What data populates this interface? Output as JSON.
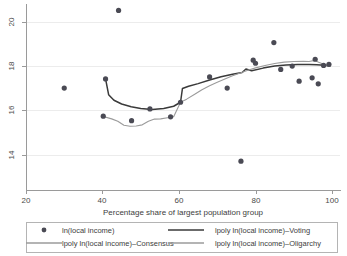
{
  "chart_data": {
    "type": "scatter",
    "title": "",
    "xlabel": "Percentage share of largest population group",
    "ylabel": "",
    "xlim": [
      20,
      100
    ],
    "ylim": [
      13.2,
      20.9
    ],
    "xticks": [
      20,
      40,
      60,
      80,
      100
    ],
    "yticks": [
      14,
      16,
      18,
      20
    ],
    "xticklabels": [
      "20",
      "40",
      "60",
      "80",
      "100"
    ],
    "yticklabels": [
      "14",
      "16",
      "18",
      "20"
    ],
    "grid": "horizontal",
    "legend_position": "below-axes",
    "marker_color": "#4a4a54",
    "series": [
      {
        "name": "ln(local income)",
        "type": "scatter",
        "color": "#4a4a54",
        "points": [
          [
            30.0,
            17.02
          ],
          [
            40.2,
            15.75
          ],
          [
            40.8,
            17.43
          ],
          [
            44.2,
            20.52
          ],
          [
            47.6,
            15.55
          ],
          [
            52.4,
            16.08
          ],
          [
            57.8,
            15.72
          ],
          [
            60.4,
            16.38
          ],
          [
            68.0,
            17.52
          ],
          [
            72.6,
            17.02
          ],
          [
            76.2,
            13.72
          ],
          [
            79.4,
            18.28
          ],
          [
            80.0,
            18.14
          ],
          [
            84.8,
            19.07
          ],
          [
            86.6,
            17.86
          ],
          [
            89.6,
            18.01
          ],
          [
            91.4,
            17.33
          ],
          [
            94.8,
            17.48
          ],
          [
            95.6,
            18.32
          ],
          [
            96.4,
            17.21
          ],
          [
            97.8,
            18.04
          ],
          [
            99.2,
            18.09
          ]
        ]
      },
      {
        "name": "lpoly ln(local income)-Consensus",
        "type": "line",
        "color": "#9b9b9b",
        "width": 1.1,
        "points": [
          [
            40.2,
            15.74
          ],
          [
            42.4,
            15.63
          ],
          [
            44.0,
            15.52
          ],
          [
            45.6,
            15.34
          ],
          [
            47.2,
            15.3
          ],
          [
            48.8,
            15.31
          ],
          [
            50.4,
            15.36
          ],
          [
            52.0,
            15.52
          ],
          [
            53.6,
            15.62
          ],
          [
            55.2,
            15.63
          ],
          [
            57.0,
            15.68
          ],
          [
            58.6,
            15.73
          ],
          [
            60.4,
            16.38
          ]
        ]
      },
      {
        "name": "lpoly ln(local income)-Voting",
        "type": "line",
        "color": "#3a3a3a",
        "width": 1.5,
        "points": [
          [
            40.8,
            17.43
          ],
          [
            41.6,
            16.72
          ],
          [
            43.0,
            16.47
          ],
          [
            45.0,
            16.3
          ],
          [
            47.5,
            16.18
          ],
          [
            50.0,
            16.1
          ],
          [
            53.0,
            16.05
          ],
          [
            56.0,
            16.1
          ],
          [
            58.6,
            16.2
          ],
          [
            60.4,
            16.38
          ],
          [
            60.9,
            17.0
          ],
          [
            62.5,
            17.1
          ],
          [
            65.0,
            17.22
          ],
          [
            68.0,
            17.38
          ],
          [
            71.0,
            17.53
          ],
          [
            74.0,
            17.64
          ],
          [
            76.5,
            17.72
          ],
          [
            77.5,
            17.88
          ],
          [
            79.0,
            17.8
          ],
          [
            82.0,
            17.92
          ],
          [
            85.0,
            18.01
          ],
          [
            88.0,
            18.06
          ],
          [
            91.0,
            18.08
          ],
          [
            94.0,
            18.08
          ],
          [
            96.0,
            18.07
          ],
          [
            98.0,
            18.05
          ],
          [
            99.5,
            18.02
          ]
        ]
      },
      {
        "name": "lpoly ln(local income)-Oligarchy",
        "type": "line",
        "color": "#9b9b9b",
        "width": 1.1,
        "points": [
          [
            60.4,
            16.38
          ],
          [
            62.0,
            16.52
          ],
          [
            64.0,
            16.73
          ],
          [
            66.0,
            16.94
          ],
          [
            68.0,
            17.12
          ],
          [
            70.0,
            17.28
          ],
          [
            72.0,
            17.43
          ],
          [
            74.0,
            17.57
          ],
          [
            76.0,
            17.7
          ],
          [
            78.0,
            17.82
          ],
          [
            80.0,
            17.93
          ],
          [
            82.5,
            18.04
          ],
          [
            85.0,
            18.13
          ],
          [
            87.5,
            18.19
          ],
          [
            90.0,
            18.22
          ],
          [
            92.5,
            18.23
          ],
          [
            94.0,
            18.22
          ],
          [
            95.5,
            18.27
          ],
          [
            96.5,
            18.18
          ],
          [
            98.0,
            18.08
          ],
          [
            99.5,
            18.0
          ]
        ]
      }
    ],
    "legend_entries": [
      {
        "label": "ln(local income)",
        "symbol": "dot",
        "color": "#4a4a54"
      },
      {
        "label": "lpoly ln(local income)–Voting",
        "symbol": "line",
        "color": "#3a3a3a"
      },
      {
        "label": "lpoly ln(local income)–Consensus",
        "symbol": "line",
        "color": "#9b9b9b"
      },
      {
        "label": "lpoly ln(local income)–Oligarchy",
        "symbol": "line",
        "color": "#9b9b9b"
      }
    ]
  }
}
